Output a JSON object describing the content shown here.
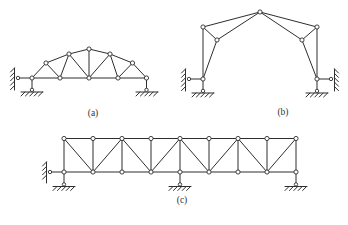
{
  "figure": {
    "canvas": {
      "width": 348,
      "height": 225,
      "background": "#ffffff"
    },
    "style": {
      "line_color": "#2e2e2e",
      "line_width": 1,
      "node_fill": "#ffffff",
      "node_radius": 2.1,
      "hinge_radius": 1.7,
      "hatch_len": 4,
      "hatch_step": 4.4,
      "label_color": "#333333",
      "label_font_size": 9.5
    },
    "labels": [
      {
        "id": "label-a",
        "text": "(a)",
        "x": 93,
        "y": 116
      },
      {
        "id": "label-b",
        "text": "(b)",
        "x": 283,
        "y": 115
      },
      {
        "id": "label-c",
        "text": "(c)",
        "x": 182,
        "y": 203
      }
    ],
    "trusses": [
      {
        "id": "truss-a",
        "nodes": {
          "B1": [
            32,
            78
          ],
          "B2": [
            60,
            78
          ],
          "B3": [
            89,
            78
          ],
          "B4": [
            118,
            78
          ],
          "B5": [
            146.5,
            78
          ],
          "T1": [
            46,
            63
          ],
          "T2": [
            69,
            54
          ],
          "T3": [
            89,
            49
          ],
          "T4": [
            110,
            54
          ],
          "T5": [
            132.5,
            63
          ]
        },
        "members": [
          [
            "B1",
            "B2"
          ],
          [
            "B2",
            "B3"
          ],
          [
            "B3",
            "B4"
          ],
          [
            "B4",
            "B5"
          ],
          [
            "B1",
            "T1"
          ],
          [
            "T1",
            "T2"
          ],
          [
            "T2",
            "T3"
          ],
          [
            "T3",
            "T4"
          ],
          [
            "T4",
            "T5"
          ],
          [
            "T5",
            "B5"
          ],
          [
            "T1",
            "B2"
          ],
          [
            "T2",
            "B2"
          ],
          [
            "T2",
            "B3"
          ],
          [
            "T3",
            "B3"
          ],
          [
            "T4",
            "B3"
          ],
          [
            "T4",
            "B4"
          ],
          [
            "T5",
            "B4"
          ]
        ],
        "supports": [
          {
            "kind": "wall-link",
            "node": "B1",
            "side": "left",
            "wall_x": 14.5,
            "wall_y1": 68,
            "wall_y2": 90,
            "hinge": [
              18,
              78
            ]
          },
          {
            "kind": "ground-link",
            "node": "B1",
            "ground_y": 92,
            "gx1": 21,
            "gx2": 43,
            "hinge": [
              32,
              89.9
            ]
          },
          {
            "kind": "ground-link",
            "node": "B5",
            "ground_y": 92,
            "gx1": 136,
            "gx2": 158,
            "hinge": [
              146.5,
              89.9
            ]
          }
        ]
      },
      {
        "id": "truss-b",
        "nodes": {
          "T": [
            260,
            12
          ],
          "UL": [
            203,
            27
          ],
          "UR": [
            317,
            27
          ],
          "IL": [
            217,
            40
          ],
          "IR": [
            302,
            40
          ],
          "BL": [
            203,
            79
          ],
          "BR": [
            317,
            79
          ]
        },
        "members": [
          [
            "UL",
            "T"
          ],
          [
            "T",
            "UR"
          ],
          [
            "T",
            "IL"
          ],
          [
            "T",
            "IR"
          ],
          [
            "UL",
            "IL"
          ],
          [
            "UR",
            "IR"
          ],
          [
            "UL",
            "BL"
          ],
          [
            "IL",
            "BL"
          ],
          [
            "UR",
            "BR"
          ],
          [
            "IR",
            "BR"
          ]
        ],
        "supports": [
          {
            "kind": "wall-link",
            "node": "BL",
            "side": "left",
            "wall_x": 185.5,
            "wall_y1": 69,
            "wall_y2": 91,
            "hinge": [
              189,
              79
            ]
          },
          {
            "kind": "ground-link",
            "node": "BL",
            "ground_y": 93,
            "gx1": 192,
            "gx2": 214,
            "hinge": [
              203,
              90.9
            ]
          },
          {
            "kind": "wall-link",
            "node": "BR",
            "side": "right",
            "wall_x": 334.5,
            "wall_y1": 69,
            "wall_y2": 91,
            "hinge": [
              331,
              79
            ]
          },
          {
            "kind": "ground-link",
            "node": "BR",
            "ground_y": 93,
            "gx1": 306,
            "gx2": 328,
            "hinge": [
              317,
              90.9
            ]
          }
        ]
      },
      {
        "id": "truss-c",
        "nodes": {
          "T1": [
            64,
            138.5
          ],
          "T2": [
            93,
            138.5
          ],
          "T3": [
            122,
            138.5
          ],
          "T4": [
            151,
            138.5
          ],
          "T5": [
            180,
            138.5
          ],
          "T6": [
            209,
            138.5
          ],
          "T7": [
            238,
            138.5
          ],
          "T8": [
            267,
            138.5
          ],
          "T9": [
            296,
            138.5
          ],
          "B1": [
            64,
            172
          ],
          "B2": [
            93,
            172
          ],
          "B3": [
            122,
            172
          ],
          "B4": [
            151,
            172
          ],
          "B5": [
            180,
            172
          ],
          "B6": [
            209,
            172
          ],
          "B7": [
            238,
            172
          ],
          "B8": [
            267,
            172
          ],
          "B9": [
            296,
            172
          ]
        },
        "members": [
          [
            "T1",
            "T2"
          ],
          [
            "T2",
            "T3"
          ],
          [
            "T3",
            "T4"
          ],
          [
            "T4",
            "T5"
          ],
          [
            "T5",
            "T6"
          ],
          [
            "T6",
            "T7"
          ],
          [
            "T7",
            "T8"
          ],
          [
            "T8",
            "T9"
          ],
          [
            "B1",
            "B2"
          ],
          [
            "B2",
            "B3"
          ],
          [
            "B3",
            "B4"
          ],
          [
            "B4",
            "B5"
          ],
          [
            "B5",
            "B6"
          ],
          [
            "B6",
            "B7"
          ],
          [
            "B7",
            "B8"
          ],
          [
            "B8",
            "B9"
          ],
          [
            "T1",
            "B1"
          ],
          [
            "T2",
            "B2"
          ],
          [
            "T3",
            "B3"
          ],
          [
            "T4",
            "B4"
          ],
          [
            "T5",
            "B5"
          ],
          [
            "T6",
            "B6"
          ],
          [
            "T7",
            "B7"
          ],
          [
            "T8",
            "B8"
          ],
          [
            "T9",
            "B9"
          ],
          [
            "T1",
            "B2"
          ],
          [
            "T3",
            "B2"
          ],
          [
            "T3",
            "B4"
          ],
          [
            "T5",
            "B4"
          ],
          [
            "T5",
            "B6"
          ],
          [
            "T7",
            "B6"
          ],
          [
            "T7",
            "B8"
          ],
          [
            "T9",
            "B8"
          ]
        ],
        "supports": [
          {
            "kind": "wall-link",
            "node": "B1",
            "side": "left",
            "wall_x": 46.5,
            "wall_y1": 162,
            "wall_y2": 183,
            "hinge": [
              50,
              172
            ]
          },
          {
            "kind": "ground-link",
            "node": "B1",
            "ground_y": 186.5,
            "gx1": 53,
            "gx2": 75,
            "hinge": [
              64,
              184.4
            ]
          },
          {
            "kind": "ground-link",
            "node": "B5",
            "ground_y": 186.5,
            "gx1": 169,
            "gx2": 191,
            "hinge": [
              180,
              184.4
            ]
          },
          {
            "kind": "ground-link",
            "node": "B9",
            "ground_y": 186.5,
            "gx1": 285,
            "gx2": 307,
            "hinge": [
              296,
              184.4
            ]
          }
        ]
      }
    ]
  }
}
